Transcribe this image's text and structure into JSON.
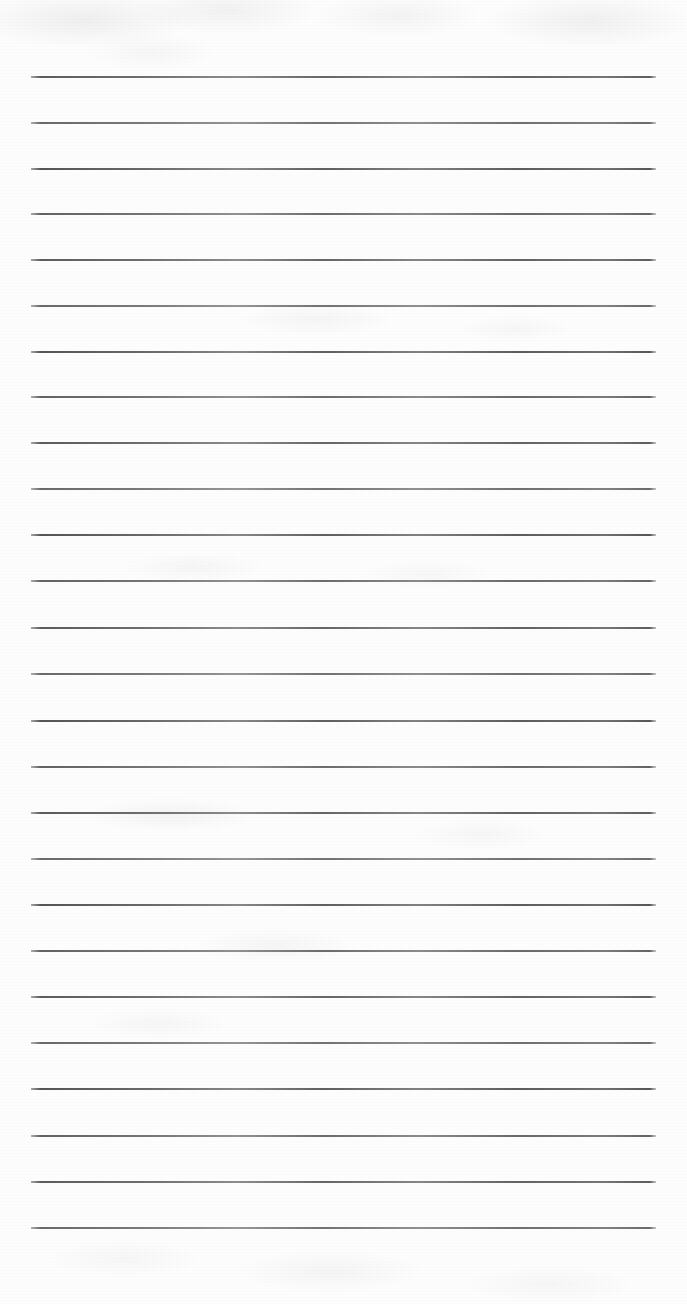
{
  "document": {
    "kind": "scanned-ruled-paper",
    "title": "Blank Ruled Notepad Page",
    "page_width": 687,
    "page_height": 1304,
    "content_text": "",
    "background_color": "#fdfdfd",
    "rule_color": "#5a5c62",
    "smudge_color": "#bcbec4"
  },
  "ruling": {
    "line_count": 26,
    "line_left_x": 31,
    "line_right_x": 656,
    "line_width": 625,
    "line_thickness": 2,
    "first_line_y": 76,
    "line_spacing": 46,
    "has_vertical_margin_rule": false,
    "line_y_positions": [
      76,
      122,
      168,
      213,
      259,
      305,
      351,
      396,
      442,
      488,
      534,
      580,
      627,
      673,
      720,
      766,
      812,
      858,
      904,
      950,
      996,
      1042,
      1088,
      1135,
      1181,
      1227
    ]
  },
  "margins": {
    "top_blank_height": 76,
    "bottom_blank_height": 77,
    "left_blank_width": 31,
    "right_blank_width": 31
  },
  "artifacts": {
    "top_smudge_band": "faint gray scanner mottling across the top edge",
    "bottom_smudge_band": "faint gray scanner mottling across the bottom edge",
    "mid_smudges": "scattered light gray marks between rules"
  }
}
